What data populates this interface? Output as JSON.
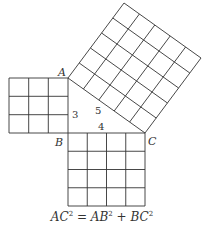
{
  "diagram": {
    "points": {
      "A": {
        "label": "A",
        "x": 68,
        "y": 78
      },
      "B": {
        "label": "B",
        "x": 68,
        "y": 133
      },
      "C": {
        "label": "C",
        "x": 145,
        "y": 133
      }
    },
    "side_labels": {
      "AB": "3",
      "BC": "4",
      "AC": "5"
    },
    "squares": [
      {
        "name": "square-on-AB",
        "grid": 3
      },
      {
        "name": "square-on-BC",
        "grid": 4
      },
      {
        "name": "square-on-AC",
        "grid": 5
      }
    ],
    "formula": {
      "lhs": "AC",
      "lhs_exp": "2",
      "eq": " = ",
      "t1": "AB",
      "t1_exp": "2",
      "plus": " + ",
      "t2": "BC",
      "t2_exp": "2"
    }
  }
}
